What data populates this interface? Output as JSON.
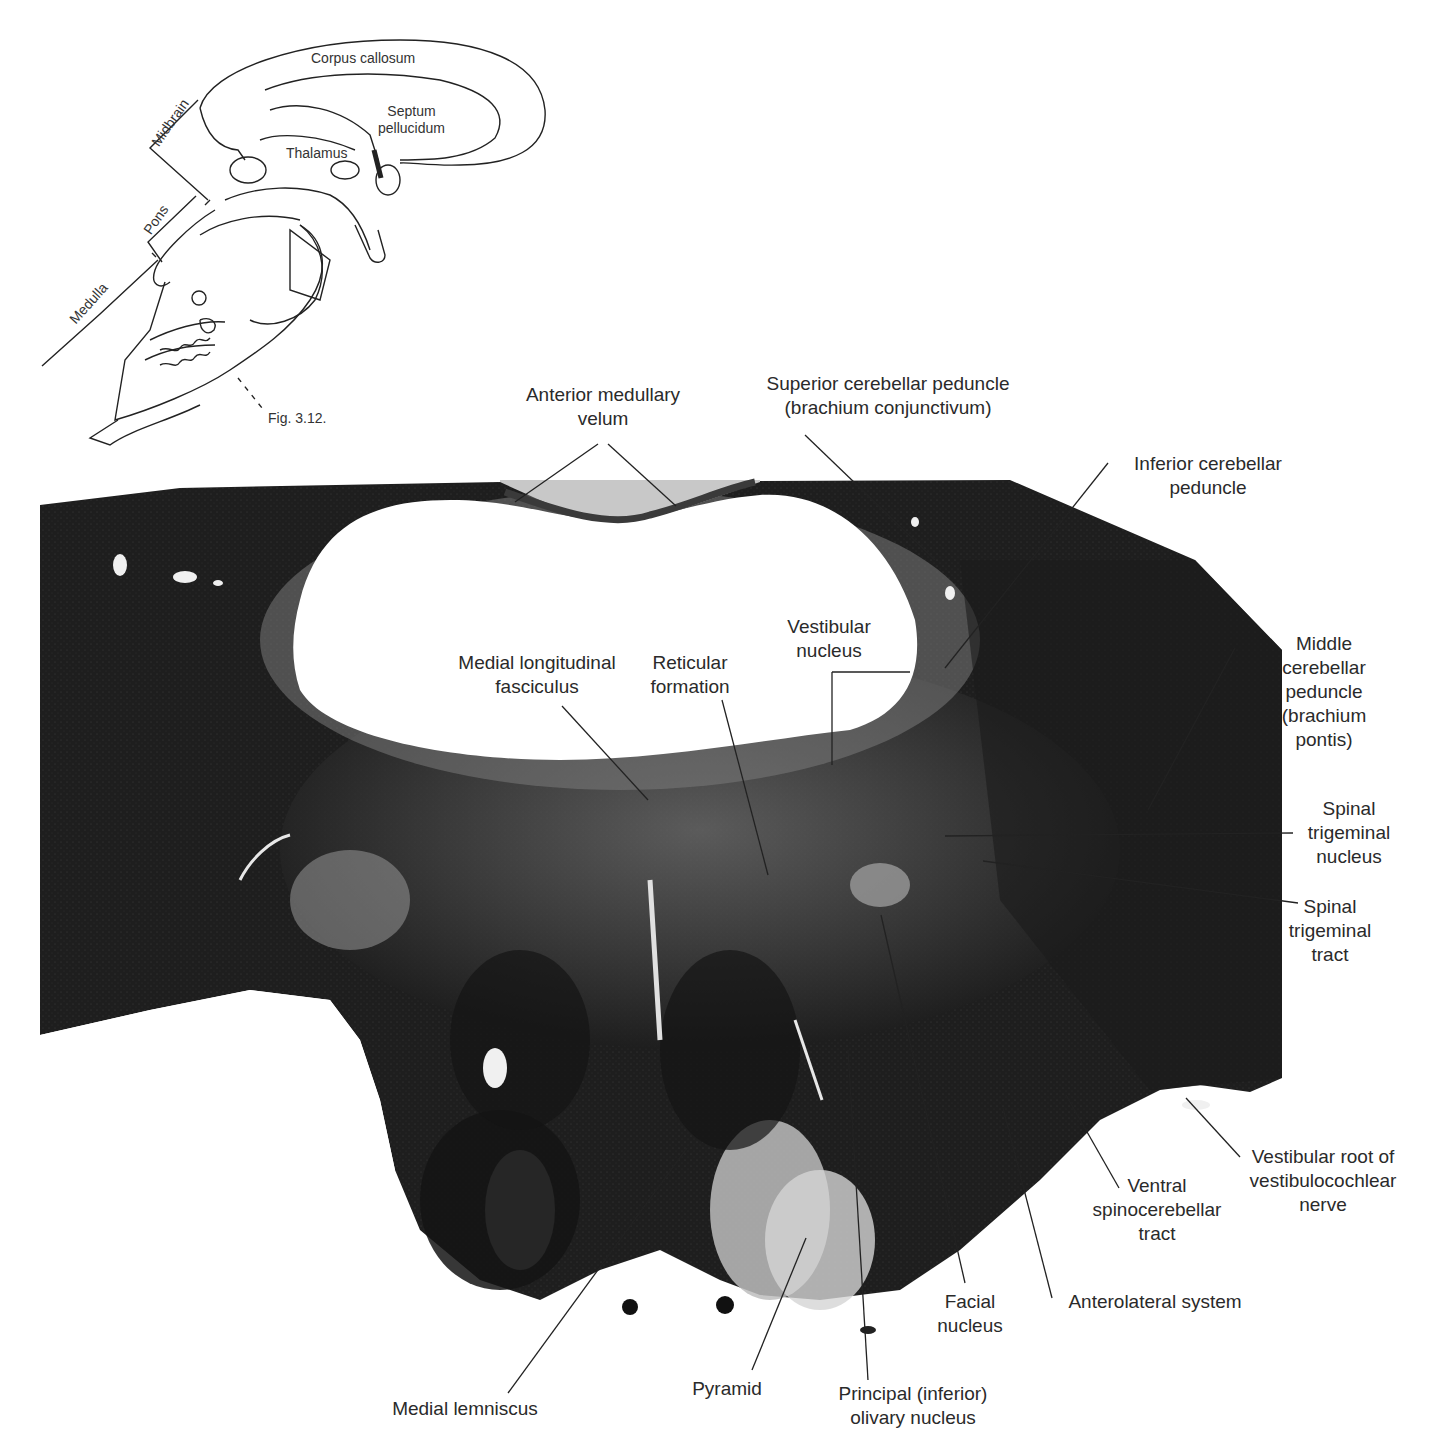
{
  "figure": {
    "inset": {
      "labels": {
        "corpus_callosum": "Corpus callosum",
        "septum_pellucidum": "Septum\npellucidum",
        "thalamus": "Thalamus",
        "midbrain": "Midbrain",
        "pons": "Pons",
        "medulla": "Medulla",
        "fig_ref": "Fig. 3.12."
      }
    },
    "colors": {
      "tissue_dark": "#1c1c1c",
      "tissue_mid": "#4a4a4a",
      "tissue_light": "#8a8a8a",
      "ventricle": "#ffffff",
      "leader_line": "#222222"
    },
    "labels": [
      {
        "id": "anterior-medullary-velum",
        "text": "Anterior medullary\nvelum",
        "x": 603,
        "y": 383
      },
      {
        "id": "superior-cerebellar-peduncle",
        "text": "Superior cerebellar peduncle\n(brachium conjunctivum)",
        "x": 888,
        "y": 372
      },
      {
        "id": "inferior-cerebellar-peduncle",
        "text": "Inferior cerebellar\npeduncle",
        "x": 1208,
        "y": 452
      },
      {
        "id": "middle-cerebellar-peduncle",
        "text": "Middle cerebellar\npeduncle\n(brachium pontis)",
        "x": 1324,
        "y": 632
      },
      {
        "id": "vestibular-nucleus",
        "text": "Vestibular\nnucleus",
        "x": 829,
        "y": 615
      },
      {
        "id": "medial-longitudinal-fasciculus",
        "text": "Medial longitudinal\nfasciculus",
        "x": 537,
        "y": 651
      },
      {
        "id": "reticular-formation",
        "text": "Reticular\nformation",
        "x": 690,
        "y": 651
      },
      {
        "id": "spinal-trigeminal-nucleus",
        "text": "Spinal\ntrigeminal\nnucleus",
        "x": 1349,
        "y": 797
      },
      {
        "id": "spinal-trigeminal-tract",
        "text": "Spinal\ntrigeminal\ntract",
        "x": 1330,
        "y": 895
      },
      {
        "id": "vestibular-root",
        "text": "Vestibular root of\nvestibulocochlear\nnerve",
        "x": 1323,
        "y": 1145
      },
      {
        "id": "ventral-spinocerebellar-tract",
        "text": "Ventral\nspinocerebellar\ntract",
        "x": 1157,
        "y": 1174
      },
      {
        "id": "anterolateral-system",
        "text": "Anterolateral system",
        "x": 1155,
        "y": 1290
      },
      {
        "id": "facial-nucleus",
        "text": "Facial\nnucleus",
        "x": 970,
        "y": 1290
      },
      {
        "id": "principal-olivary-nucleus",
        "text": "Principal (inferior)\nolivary nucleus",
        "x": 913,
        "y": 1382
      },
      {
        "id": "pyramid",
        "text": "Pyramid",
        "x": 727,
        "y": 1377
      },
      {
        "id": "medial-lemniscus",
        "text": "Medial lemniscus",
        "x": 465,
        "y": 1397
      }
    ],
    "leader_lines": [
      {
        "for": "anterior-medullary-velum",
        "x1": 598,
        "y1": 444,
        "x2": 515,
        "y2": 502
      },
      {
        "for": "anterior-medullary-velum",
        "x1": 608,
        "y1": 444,
        "x2": 676,
        "y2": 506
      },
      {
        "for": "superior-cerebellar-peduncle",
        "x1": 805,
        "y1": 435,
        "x2": 935,
        "y2": 560
      },
      {
        "for": "inferior-cerebellar-peduncle",
        "x1": 1108,
        "y1": 463,
        "x2": 945,
        "y2": 668
      },
      {
        "for": "middle-cerebellar-peduncle",
        "x1": 1235,
        "y1": 648,
        "x2": 1148,
        "y2": 810
      },
      {
        "for": "vestibular-nucleus",
        "x1": 910,
        "y1": 672,
        "x2": 832,
        "y2": 672
      },
      {
        "for": "vestibular-nucleus",
        "x1": 832,
        "y1": 672,
        "x2": 832,
        "y2": 765
      },
      {
        "for": "medial-longitudinal-fasciculus",
        "x1": 562,
        "y1": 706,
        "x2": 648,
        "y2": 800
      },
      {
        "for": "reticular-formation",
        "x1": 722,
        "y1": 700,
        "x2": 768,
        "y2": 875
      },
      {
        "for": "spinal-trigeminal-nucleus",
        "x1": 1293,
        "y1": 833,
        "x2": 945,
        "y2": 836
      },
      {
        "for": "spinal-trigeminal-tract",
        "x1": 1298,
        "y1": 903,
        "x2": 983,
        "y2": 861
      },
      {
        "for": "vestibular-root",
        "x1": 1240,
        "y1": 1157,
        "x2": 1186,
        "y2": 1098
      },
      {
        "for": "ventral-spinocerebellar-tract",
        "x1": 1119,
        "y1": 1188,
        "x2": 1066,
        "y2": 1095
      },
      {
        "for": "anterolateral-system",
        "x1": 1052,
        "y1": 1298,
        "x2": 1003,
        "y2": 1108
      },
      {
        "for": "facial-nucleus",
        "x1": 965,
        "y1": 1283,
        "x2": 881,
        "y2": 915
      },
      {
        "for": "principal-olivary-nucleus",
        "x1": 868,
        "y1": 1380,
        "x2": 848,
        "y2": 1050
      },
      {
        "for": "pyramid",
        "x1": 752,
        "y1": 1370,
        "x2": 806,
        "y2": 1238
      },
      {
        "for": "medial-lemniscus",
        "x1": 508,
        "y1": 1393,
        "x2": 687,
        "y2": 1148
      }
    ]
  }
}
